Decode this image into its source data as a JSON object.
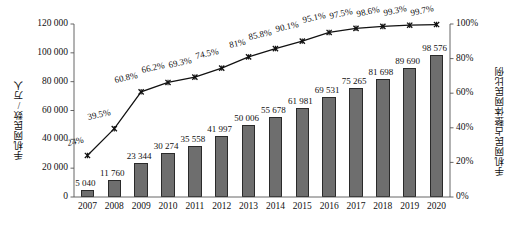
{
  "chart_data": {
    "type": "bar",
    "title": "",
    "subtitle": "",
    "xlabel": "",
    "ylabel": "手机网民数/万人",
    "y2label": "手机网民占整体网民比例",
    "categories": [
      "2007",
      "2008",
      "2009",
      "2010",
      "2011",
      "2012",
      "2013",
      "2014",
      "2015",
      "2016",
      "2017",
      "2018",
      "2019",
      "2020"
    ],
    "ylim": [
      0,
      120000
    ],
    "yticks": [
      "0",
      "20 000",
      "40 000",
      "60 000",
      "80 000",
      "100 000",
      "120 000"
    ],
    "ytick_values": [
      0,
      20000,
      40000,
      60000,
      80000,
      100000,
      120000
    ],
    "y2lim": [
      0,
      100
    ],
    "y2ticks": [
      "0%",
      "20%",
      "40%",
      "60%",
      "80%",
      "100%"
    ],
    "y2tick_values": [
      0,
      20,
      40,
      60,
      80,
      100
    ],
    "grid": false,
    "legend": "none",
    "series": [
      {
        "name": "手机网民数/万人",
        "type": "bar",
        "axis": "left",
        "values": [
          5040,
          11760,
          23344,
          30274,
          35558,
          41997,
          50006,
          55678,
          61981,
          69531,
          75265,
          81698,
          89690,
          98576
        ],
        "labels": [
          "5 040",
          "11 760",
          "23 344",
          "30 274",
          "35 558",
          "41 997",
          "50 006",
          "55 678",
          "61 981",
          "69 531",
          "75 265",
          "81 698",
          "89 690",
          "98 576"
        ]
      },
      {
        "name": "手机网民占整体网民比例",
        "type": "line",
        "axis": "right",
        "marker": "x-cross",
        "values": [
          24,
          39.5,
          60.8,
          66.2,
          69.3,
          74.5,
          81,
          85.8,
          90.1,
          95.1,
          97.5,
          98.6,
          99.3,
          99.7
        ],
        "labels": [
          "24%",
          "39.5%",
          "60.8%",
          "66.2%",
          "69.3%",
          "74.5%",
          "81%",
          "85.8%",
          "90.1%",
          "95.1%",
          "97.5%",
          "98.6%",
          "99.3%",
          "99.7%"
        ]
      }
    ],
    "colors": {
      "bar_fill": "#6e6e6e",
      "bar_edge": "#2a2a2a",
      "line": "#111111",
      "axis": "#555555",
      "text": "#111111"
    }
  }
}
